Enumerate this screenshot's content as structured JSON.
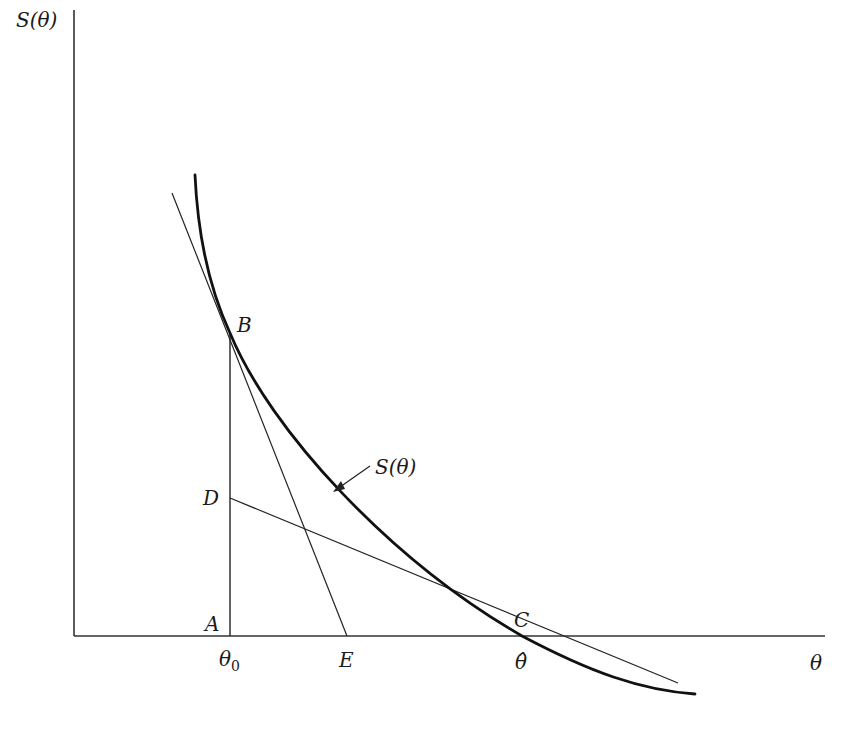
{
  "figure": {
    "type": "diagram",
    "axes": {
      "y_label": "S(θ)",
      "x_label": "θ"
    },
    "curve_label": "S(θ)",
    "points": {
      "A": "A",
      "B": "B",
      "C": "C",
      "D": "D",
      "E": "E"
    },
    "x_ticks": {
      "theta0": "θ",
      "theta0_sub": "0",
      "E": "E",
      "theta_hat": "θ̂"
    },
    "colors": {
      "ink": "#1a1a1a",
      "background": "#ffffff"
    }
  }
}
